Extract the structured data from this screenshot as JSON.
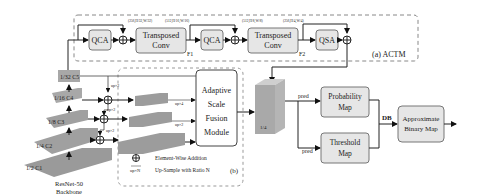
{
  "diagram": {
    "actm": {
      "label": "(a) ACTM",
      "blocks": {
        "qca1": "QCA",
        "tconv1_line1": "Transposed",
        "tconv1_line2": "Conv",
        "qca2": "QCA",
        "tconv2_line1": "Transposed",
        "tconv2_line2": "Conv",
        "qsa": "QSA"
      },
      "feature_labels": {
        "f1": "F1",
        "f2": "F2"
      },
      "dim_labels": [
        "(256,H/32,W/32)",
        "(512,H/16,W/16)",
        "(512,H/8,W/8)",
        "(256,H/4,W/4)"
      ]
    },
    "backbone": {
      "name_line1": "ResNet-50",
      "name_line2": "Backbone",
      "layers": [
        "1/32 C5",
        "1/16 C4",
        "1/8 C3",
        "1/4 C2",
        "1/2 C1"
      ]
    },
    "fusion": {
      "label": "(b)",
      "up_labels": [
        "up×2",
        "up×2",
        "up×2",
        "up×8",
        "up×4",
        "up×2"
      ],
      "module_lines": [
        "Adaptive",
        "Scale",
        "Fusion",
        "Module"
      ],
      "legend": {
        "add_text": "Element-Wise Addition",
        "up_symbol": "up×N",
        "up_text": "Up-Sample with Ratio N"
      }
    },
    "feature_map_label": "1/4",
    "pred_labels": [
      "pred",
      "pred"
    ],
    "probability_map": [
      "Probability",
      "Map"
    ],
    "threshold_map": [
      "Threshold",
      "Map"
    ],
    "db_label": "DB",
    "binary_map": [
      "Approximate",
      "Binary Map"
    ],
    "colors": {
      "box_fill": "#e6e6e6",
      "box_stroke": "#777777",
      "layer_top": "#9a9a9a",
      "layer_side": "#c8c8c8",
      "dash": "#888888"
    }
  }
}
